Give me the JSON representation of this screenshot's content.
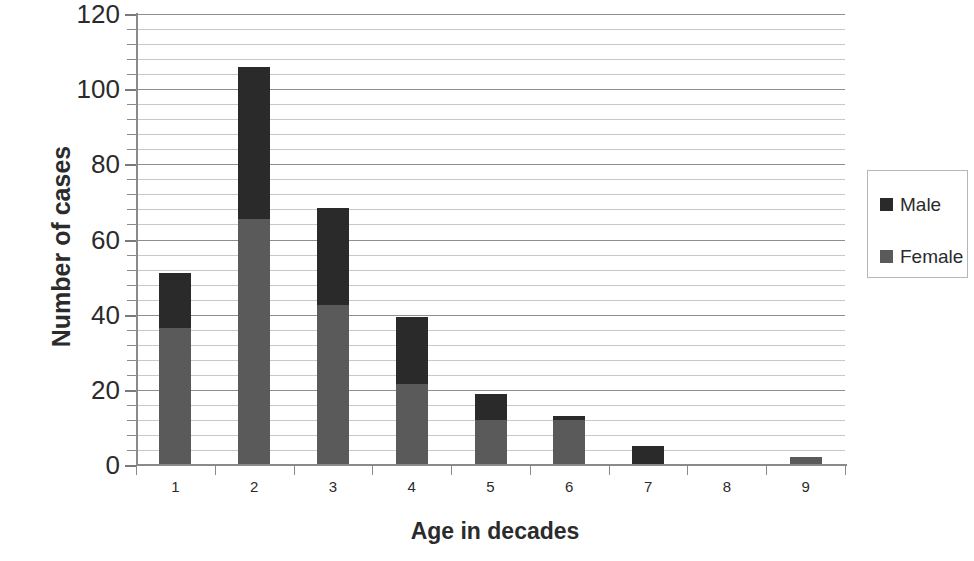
{
  "chart_data": {
    "type": "bar",
    "stacked": true,
    "title": "",
    "xlabel": "Age in decades",
    "ylabel": "Number of cases",
    "categories": [
      "1",
      "2",
      "3",
      "4",
      "5",
      "6",
      "7",
      "8",
      "9"
    ],
    "series": [
      {
        "name": "Female",
        "color": "#5a5a5a",
        "values": [
          36.5,
          65.5,
          42.5,
          21.5,
          12,
          12,
          0,
          0,
          2
        ]
      },
      {
        "name": "Male",
        "color": "#2a2a2a",
        "values": [
          14.5,
          40.5,
          26,
          18,
          7,
          1,
          5,
          0,
          0
        ]
      }
    ],
    "totals": [
      51,
      106,
      68.5,
      39.5,
      19,
      13,
      5,
      0,
      2
    ],
    "ylim": [
      0,
      120
    ],
    "ymajor_ticks": [
      0,
      20,
      40,
      60,
      80,
      100,
      120
    ],
    "yminor_step": 4,
    "grid": true,
    "legend_position": "right",
    "legend_entries": [
      "Male",
      "Female"
    ]
  },
  "axes": {
    "y_title": "Number of cases",
    "x_title": "Age in decades",
    "y_tick_labels": [
      "120",
      "100",
      "80",
      "60",
      "40",
      "20",
      "0"
    ],
    "x_tick_labels": [
      "1",
      "2",
      "3",
      "4",
      "5",
      "6",
      "7",
      "8",
      "9"
    ]
  },
  "legend": {
    "items": [
      {
        "label": "Male",
        "color": "#2a2a2a"
      },
      {
        "label": "Female",
        "color": "#5a5a5a"
      }
    ]
  },
  "colors": {
    "male": "#2a2a2a",
    "female": "#5a5a5a",
    "gridline_minor": "#c8c8c8",
    "gridline_major": "#8e8e8e",
    "axis": "#8a8a8a",
    "text": "#2b2b2b",
    "background": "#ffffff"
  }
}
